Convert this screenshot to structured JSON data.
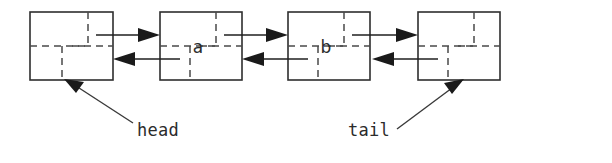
{
  "figure": {
    "type": "doubly-linked-list-diagram",
    "background_color": "#ffffff",
    "line_color": "#1f1f1f",
    "width": 612,
    "height": 163
  },
  "nodes": [
    {
      "id": "node-1",
      "value": "",
      "x": 30,
      "y": 12,
      "width": 83,
      "height": 68
    },
    {
      "id": "node-2",
      "value": "a",
      "x": 160,
      "y": 12,
      "width": 82,
      "height": 68
    },
    {
      "id": "node-3",
      "value": "b",
      "x": 288,
      "y": 12,
      "width": 82,
      "height": 68
    },
    {
      "id": "node-4",
      "value": "",
      "x": 418,
      "y": 12,
      "width": 82,
      "height": 68
    }
  ],
  "links": [
    {
      "id": "link-1-forward",
      "direction": "right",
      "from": "node-1",
      "to": "node-2"
    },
    {
      "id": "link-2-backward",
      "direction": "left",
      "from": "node-2",
      "to": "node-1"
    },
    {
      "id": "link-2-forward",
      "direction": "right",
      "from": "node-2",
      "to": "node-3"
    },
    {
      "id": "link-3-backward",
      "direction": "left",
      "from": "node-3",
      "to": "node-2"
    },
    {
      "id": "link-3-forward",
      "direction": "right",
      "from": "node-3",
      "to": "node-4"
    },
    {
      "id": "link-4-backward",
      "direction": "left",
      "from": "node-4",
      "to": "node-3"
    }
  ],
  "annotations": [
    {
      "id": "head",
      "label": "head",
      "text_x": 137,
      "text_y": 136,
      "points_to": "node-1"
    },
    {
      "id": "tail",
      "label": "tail",
      "text_x": 348,
      "text_y": 136,
      "points_to": "node-4"
    }
  ]
}
